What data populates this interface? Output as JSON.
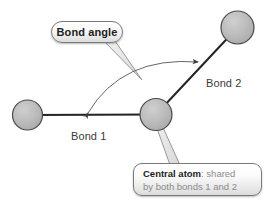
{
  "diagram": {
    "type": "molecular-bond-angle-diagram",
    "background_color": "#ffffff",
    "atoms": [
      {
        "id": "atom-left",
        "name": "left-terminal-atom",
        "cx": 27.5,
        "cy": 115.0,
        "r": 15.0
      },
      {
        "id": "atom-center",
        "name": "central-atom",
        "cx": 156.0,
        "cy": 114.5,
        "r": 16.0
      },
      {
        "id": "atom-upright",
        "name": "upper-right-terminal-atom",
        "cx": 237.5,
        "cy": 27.5,
        "r": 16.5
      }
    ],
    "atom_style": {
      "fill": "#b9b9b9",
      "stroke": "#4a4a4a",
      "stroke_width": 1.2
    },
    "bonds": [
      {
        "id": "bond-1",
        "label": "Bond 1",
        "from": "atom-left",
        "to": "atom-center",
        "x1": 42,
        "y1": 115,
        "x2": 156,
        "y2": 114.5
      },
      {
        "id": "bond-2",
        "label": "Bond 2",
        "from": "atom-center",
        "to": "atom-upright",
        "x1": 156,
        "y1": 114.5,
        "x2": 226,
        "y2": 39
      }
    ],
    "bond_style": {
      "stroke": "#232323",
      "stroke_width": 2
    },
    "labels": {
      "bond1": "Bond 1",
      "bond2": "Bond 2"
    },
    "angle_arc": {
      "name": "bond-angle-arc",
      "start": {
        "x": 86,
        "y": 114
      },
      "end": {
        "x": 200,
        "y": 62
      },
      "control": {
        "x": 120,
        "y": 58
      },
      "stroke": "#555555",
      "stroke_width": 0.9,
      "arrowheads": "both"
    }
  },
  "callouts": {
    "bond_angle": {
      "name": "bond-angle-callout",
      "shape": "pill",
      "text": "Bond angle",
      "x": 51,
      "y": 21,
      "w": 72,
      "h": 22,
      "tail": {
        "from_x": 110,
        "from_y": 41,
        "to_x": 141,
        "to_y": 79
      }
    },
    "central_atom": {
      "name": "central-atom-callout",
      "shape": "rounded-rect",
      "line1_strong": "Central atom",
      "line1_rest": ": shared",
      "line2": "by both bonds 1 and 2",
      "x": 133,
      "y": 163,
      "w": 129,
      "h": 33,
      "tail": {
        "from_x": 155,
        "from_y": 119,
        "to_x": 176,
        "to_y": 164
      }
    }
  },
  "colors": {
    "atom_fill": "#b9b9b9",
    "atom_stroke": "#4a4a4a",
    "bond_stroke": "#232323",
    "arc_stroke": "#555555",
    "callout_border": "#7a7a7a",
    "text_dark": "#1d1d1d",
    "text_gray": "#8b8b8b",
    "label_gray": "#3a3a3a"
  }
}
